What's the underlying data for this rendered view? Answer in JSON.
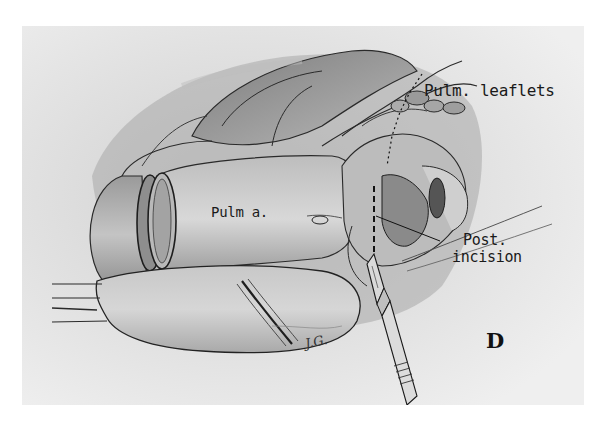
{
  "figure": {
    "panel_letter": "D",
    "signature": "J.G.",
    "labels": {
      "pulm_leaflets": "Pulm. leaflets",
      "pulm_a": "Pulm a.",
      "post_incision_line1": "Post.",
      "post_incision_line2": "incision"
    },
    "colors": {
      "page_background": "#ffffff",
      "panel_background": "#e9e9e9",
      "ink": "#1a1a1a"
    }
  }
}
